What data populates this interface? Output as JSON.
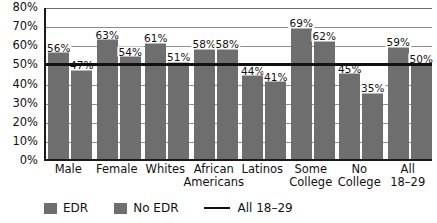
{
  "chart_data": {
    "type": "bar",
    "title": "",
    "subtitle": "",
    "xlabel": "",
    "ylabel": "",
    "ylim": [
      0,
      80
    ],
    "ytick_labels": [
      "0%",
      "10%",
      "20%",
      "30%",
      "40%",
      "50%",
      "60%",
      "70%",
      "80%"
    ],
    "ytick_values": [
      0,
      10,
      20,
      30,
      40,
      50,
      60,
      70,
      80
    ],
    "grid": true,
    "legend_position": "bottom-left",
    "categories": [
      "Male",
      "Female",
      "Whites",
      "African Americans",
      "Latinos",
      "Some College",
      "No College",
      "All 18–29"
    ],
    "category_lines": [
      [
        "Male"
      ],
      [
        "Female"
      ],
      [
        "Whites"
      ],
      [
        "African",
        "Americans"
      ],
      [
        "Latinos"
      ],
      [
        "Some",
        "College"
      ],
      [
        "No",
        "College"
      ],
      [
        "All",
        "18–29"
      ]
    ],
    "series": [
      {
        "name": "EDR",
        "color": "#6e6e6e",
        "values": [
          56,
          63,
          61,
          58,
          44,
          69,
          45,
          59
        ],
        "value_labels": [
          "56%",
          "63%",
          "61%",
          "58%",
          "44%",
          "69%",
          "45%",
          "59%"
        ]
      },
      {
        "name": "No EDR",
        "color": "#6e6e6e",
        "values": [
          47,
          54,
          51,
          58,
          41,
          62,
          35,
          50
        ],
        "value_labels": [
          "47%",
          "54%",
          "51%",
          "58%",
          "41%",
          "62%",
          "35%",
          "50%"
        ]
      }
    ],
    "reference_line": {
      "name": "All 18–29",
      "value": 51,
      "color": "#111111"
    },
    "legend": [
      {
        "label": "EDR",
        "marker": "swatch",
        "color": "#6e6e6e"
      },
      {
        "label": "No EDR",
        "marker": "swatch",
        "color": "#6e6e6e"
      },
      {
        "label": "All 18–29",
        "marker": "line",
        "color": "#111111"
      }
    ]
  }
}
